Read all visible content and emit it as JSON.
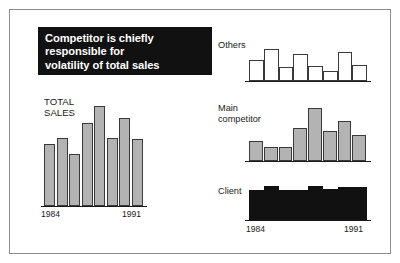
{
  "slide": {
    "banner": {
      "lines": [
        "Competitor is chiefly",
        "responsible for",
        "volatility of total sales"
      ],
      "background_color": "#111111",
      "text_color": "#ffffff"
    },
    "colors": {
      "total_sales_bar": "#b3b3b3",
      "main_competitor_bar": "#b3b3b3",
      "others_bar": "#ffffff",
      "client_bar": "#111111",
      "bar_outline": "#3a3a3a",
      "axis": "#1a1a1a",
      "frame": "#8d8d8d",
      "page_background": "#ffffff"
    }
  },
  "chart_data": [
    {
      "id": "total-sales",
      "type": "bar",
      "title": "TOTAL SALES",
      "title_lines": [
        "TOTAL",
        "SALES"
      ],
      "xlabel": "",
      "ylabel": "",
      "categories": [
        "1984",
        "1985",
        "1986",
        "1987",
        "1988",
        "1989",
        "1990",
        "1991"
      ],
      "tick_labels": [
        "1984",
        "1991"
      ],
      "values": [
        62,
        68,
        52,
        83,
        100,
        68,
        88,
        67
      ],
      "ylim": [
        0,
        100
      ],
      "grid": false,
      "legend": "none",
      "bar_style": "gray-filled-outlined"
    },
    {
      "id": "others",
      "type": "bar",
      "title": "Others",
      "xlabel": "",
      "ylabel": "",
      "categories": [
        "1984",
        "1985",
        "1986",
        "1987",
        "1988",
        "1989",
        "1990",
        "1991"
      ],
      "tick_labels": [],
      "values": [
        66,
        100,
        44,
        84,
        46,
        30,
        92,
        50
      ],
      "ylim": [
        0,
        100
      ],
      "grid": false,
      "legend": "none",
      "bar_style": "white-outlined"
    },
    {
      "id": "main-competitor",
      "type": "bar",
      "title": "Main competitor",
      "title_lines": [
        "Main",
        "competitor"
      ],
      "xlabel": "",
      "ylabel": "",
      "categories": [
        "1984",
        "1985",
        "1986",
        "1987",
        "1988",
        "1989",
        "1990",
        "1991"
      ],
      "tick_labels": [],
      "values": [
        38,
        26,
        26,
        62,
        100,
        56,
        76,
        50
      ],
      "ylim": [
        0,
        100
      ],
      "grid": false,
      "legend": "none",
      "bar_style": "gray-filled-outlined"
    },
    {
      "id": "client",
      "type": "bar",
      "title": "Client",
      "xlabel": "",
      "ylabel": "",
      "categories": [
        "1984",
        "1985",
        "1986",
        "1987",
        "1988",
        "1989",
        "1990",
        "1991"
      ],
      "tick_labels": [
        "1984",
        "1991"
      ],
      "values": [
        88,
        100,
        88,
        88,
        100,
        90,
        96,
        96
      ],
      "ylim": [
        0,
        100
      ],
      "grid": false,
      "legend": "none",
      "bar_style": "black-filled"
    }
  ]
}
